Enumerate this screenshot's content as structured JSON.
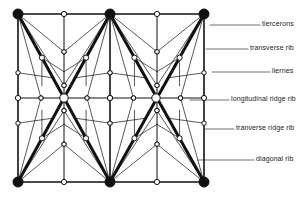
{
  "diagram": {
    "colors": {
      "ink": "#111111",
      "paper": "#ffffff"
    },
    "bays": {
      "x": [
        18,
        110,
        204
      ],
      "y": [
        14,
        182
      ],
      "mid_y": 98,
      "bosses": [
        [
          64,
          98
        ],
        [
          156,
          98
        ]
      ]
    },
    "labels": [
      {
        "text": "tiercerons",
        "x": 262,
        "y": 25,
        "leader_from": 210
      },
      {
        "text": "transverse rib",
        "x": 250,
        "y": 49,
        "leader_from": 206
      },
      {
        "text": "liernes",
        "x": 272,
        "y": 72,
        "leader_from": 212
      },
      {
        "text": "longitudinal ridge rib",
        "x": 231,
        "y": 100,
        "leader_from": 190
      },
      {
        "text": "tranverse ridge rib",
        "x": 236,
        "y": 129,
        "leader_from": 205
      },
      {
        "text": "diagonal rib",
        "x": 256,
        "y": 160,
        "leader_from": 198
      }
    ]
  }
}
